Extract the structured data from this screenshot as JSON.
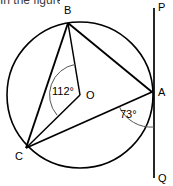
{
  "caption": {
    "text": "In the figure, the circle O."
  },
  "figure": {
    "type": "circle-geometry-diagram",
    "width": 173,
    "height": 186,
    "background_color": "#ffffff",
    "stroke_color": "#000000",
    "arc_color": "#555555"
  },
  "circle": {
    "label": "O",
    "center": {
      "x": 80,
      "y": 95
    },
    "radius": 73
  },
  "points": {
    "B": {
      "label": "B",
      "x": 68,
      "y": 23,
      "label_x": 64,
      "label_y": 14
    },
    "C": {
      "label": "C",
      "x": 26,
      "y": 148,
      "label_x": 15,
      "label_y": 160
    },
    "A": {
      "label": "A",
      "x": 152,
      "y": 92,
      "label_x": 158,
      "label_y": 96
    },
    "P": {
      "label": "P",
      "x": 154,
      "y": 8,
      "label_x": 158,
      "label_y": 11
    },
    "Q": {
      "label": "Q",
      "x": 154,
      "y": 178,
      "label_x": 158,
      "label_y": 182
    },
    "O": {
      "label": "O",
      "x": 80,
      "y": 95,
      "label_x": 86,
      "label_y": 99
    }
  },
  "segments": [
    {
      "name": "chord-BA",
      "from": "B",
      "to": "A",
      "kind": "chord"
    },
    {
      "name": "chord-BC",
      "from": "B",
      "to": "C",
      "kind": "chord"
    },
    {
      "name": "chord-AC",
      "from": "A",
      "to": "C",
      "kind": "chord"
    },
    {
      "name": "radius-OB",
      "from": "O",
      "to": "B",
      "kind": "radius"
    },
    {
      "name": "radius-OC",
      "from": "O",
      "to": "C",
      "kind": "radius"
    },
    {
      "name": "tangent-PQ",
      "from": "P",
      "to": "Q",
      "kind": "tangent"
    }
  ],
  "angles": [
    {
      "name": "central-angle-BOC",
      "value": "112°",
      "vertex": "O",
      "rays": [
        "OB",
        "OC"
      ],
      "label_x": 52,
      "label_y": 95
    },
    {
      "name": "tangent-chord-angle-CAQ",
      "value": "73°",
      "vertex": "A",
      "rays": [
        "AC",
        "AQ"
      ],
      "label_x": 120,
      "label_y": 118
    }
  ]
}
